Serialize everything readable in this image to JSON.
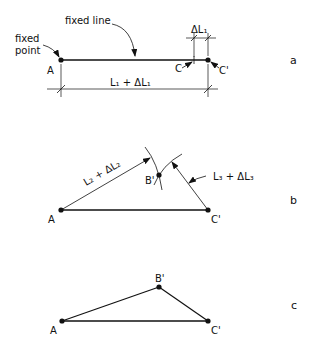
{
  "figure": {
    "panels": [
      {
        "id": "a",
        "label": "a",
        "annotations": {
          "fixed_line": "fixed line",
          "fixed_point_1": "fixed",
          "fixed_point_2": "point"
        },
        "points": {
          "A": "A",
          "C": "C",
          "C_prime": "C'"
        },
        "dimensions": {
          "total": "L₁ + ΔL₁",
          "delta": "ΔL₁"
        }
      },
      {
        "id": "b",
        "label": "b",
        "points": {
          "A": "A",
          "B_prime": "B'",
          "C_prime": "C'"
        },
        "arcs": {
          "from_A": "L₂ + ΔL₂",
          "from_C": "L₃ + ΔL₃"
        }
      },
      {
        "id": "c",
        "label": "c",
        "points": {
          "A": "A",
          "B_prime": "B'",
          "C_prime": "C'"
        }
      }
    ],
    "colors": {
      "ink": "#111111",
      "background": "#ffffff"
    }
  }
}
